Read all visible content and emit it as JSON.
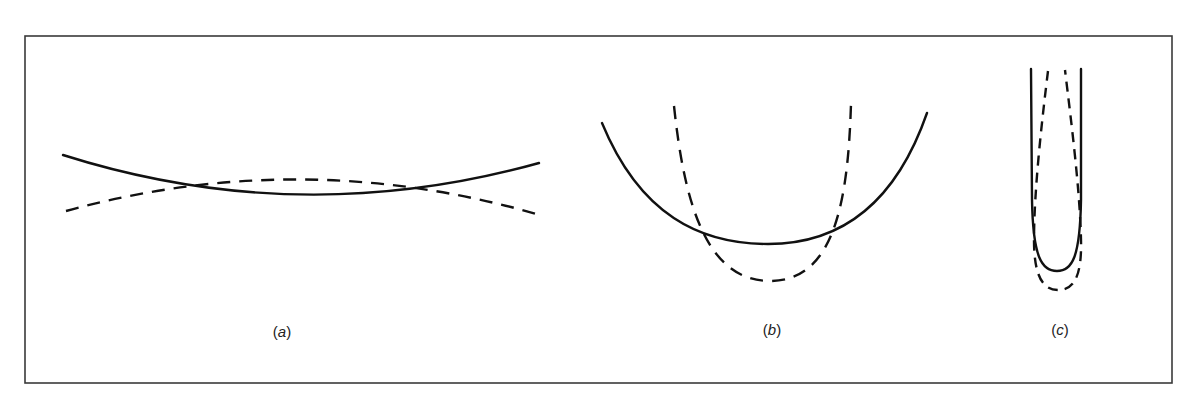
{
  "figure": {
    "panels": [
      {
        "id": "a",
        "label": "(a)",
        "label_open": "(",
        "label_letter": "a",
        "label_close": ")",
        "description": "Broad, shallow solid curve (concave up) crossing a gently concave-down dashed curve at two points",
        "solid_curve": "shallow upward-opening curve",
        "dashed_curve": "shallow downward-opening curve"
      },
      {
        "id": "b",
        "label": "(b)",
        "label_open": "(",
        "label_letter": "b",
        "label_close": ")",
        "description": "Wide solid parabola-like curve and a narrower, deeper dashed U-shaped curve intersecting at two points",
        "solid_curve": "wide U-shaped curve",
        "dashed_curve": "narrow, deeper U-shaped curve"
      },
      {
        "id": "c",
        "label": "(c)",
        "label_open": "(",
        "label_letter": "c",
        "label_close": ")",
        "description": "Very narrow solid U-shaped curve with a slightly deeper dashed U-shaped curve nested inside at the top and outside at the bottom",
        "solid_curve": "very narrow deep U-shaped curve",
        "dashed_curve": "very narrow, slightly deeper U-shaped curve"
      }
    ],
    "legend": {
      "solid": "solid line",
      "dashed": "dashed line"
    },
    "colors": {
      "line": "#111111",
      "frame": "#3a3a3a",
      "background": "#ffffff"
    }
  }
}
